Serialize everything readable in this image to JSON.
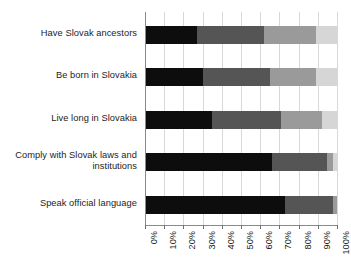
{
  "chart_data": {
    "type": "bar",
    "orientation": "horizontal",
    "stacked": true,
    "title": "",
    "subtitle": "",
    "xlabel": "",
    "ylabel": "",
    "xlim": [
      0,
      100
    ],
    "xticks": [
      0,
      10,
      20,
      30,
      40,
      50,
      60,
      70,
      80,
      90,
      100
    ],
    "xtick_labels": [
      "0%",
      "10%",
      "20%",
      "30%",
      "40%",
      "50%",
      "60%",
      "70%",
      "80%",
      "90%",
      "100%"
    ],
    "grid": true,
    "legend": "none",
    "categories": [
      "Have Slovak ancestors",
      "Be born in Slovakia",
      "Live long in Slovakia",
      "Comply with Slovak laws and institutions",
      "Speak official language"
    ],
    "series": [
      {
        "name": "segment-1",
        "color": "#0d0d0d",
        "values": [
          27,
          30,
          35,
          66,
          73
        ]
      },
      {
        "name": "segment-2",
        "color": "#555555",
        "values": [
          35,
          35,
          36,
          29,
          25
        ]
      },
      {
        "name": "segment-3",
        "color": "#9a9a9a",
        "values": [
          27,
          24,
          21,
          3,
          2
        ]
      },
      {
        "name": "segment-4",
        "color": "#d6d6d6",
        "values": [
          11,
          11,
          8,
          2,
          0
        ]
      }
    ],
    "cumulative_ends": [
      [
        27,
        62,
        89,
        100
      ],
      [
        30,
        65,
        89,
        100
      ],
      [
        35,
        71,
        92,
        100
      ],
      [
        66,
        95,
        98,
        100
      ],
      [
        73,
        98,
        100,
        100
      ]
    ]
  },
  "colors": {
    "segment_1": "#0d0d0d",
    "segment_2": "#555555",
    "segment_3": "#9a9a9a",
    "segment_4": "#d6d6d6",
    "gridline": "#d8d8d8",
    "axis": "#8a8a8a",
    "text": "#1d1d1d",
    "background": "#ffffff"
  }
}
